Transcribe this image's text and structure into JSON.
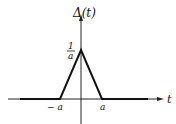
{
  "diagram": {
    "function_label": "Δ(t)",
    "x_axis_label": "t",
    "peak_label_numerator": "1",
    "peak_label_denominator": "a",
    "left_tick_label": "− a",
    "right_tick_label": "a",
    "shape": "triangle",
    "peak_value": "1/a",
    "support": [
      "-a",
      "a"
    ]
  }
}
